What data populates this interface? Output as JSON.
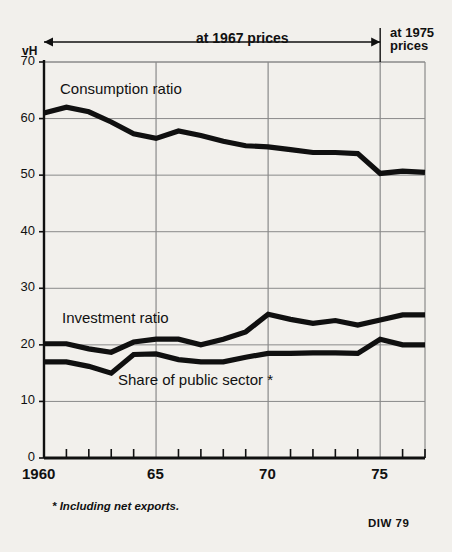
{
  "axis": {
    "unit_label": "vH",
    "y_ticks": [
      70,
      60,
      50,
      40,
      30,
      20,
      10,
      0
    ],
    "x_ticks": [
      {
        "value": 1960,
        "label": "1960"
      },
      {
        "value": 1965,
        "label": "65"
      },
      {
        "value": 1970,
        "label": "70"
      },
      {
        "value": 1975,
        "label": "75"
      }
    ]
  },
  "annotations": {
    "period_left": "at 1967 prices",
    "period_right_line1": "at 1975",
    "period_right_line2": "prices",
    "footnote": "* Including net exports.",
    "source": "DIW 79"
  },
  "series_labels": {
    "consumption": "Consumption ratio",
    "investment": "Investment ratio",
    "public_sector": "Share of public sector *"
  },
  "colors": {
    "line": "#101010",
    "grid": "#8a8a8a",
    "axis": "#101010",
    "background": "#f2f0ec"
  },
  "chart_data": {
    "type": "line",
    "title": "",
    "subtitle": "",
    "xlabel": "",
    "ylabel": "vH",
    "xlim": [
      1960,
      1977
    ],
    "ylim": [
      0,
      70
    ],
    "grid": true,
    "legend_position": "inline-labels",
    "x": [
      1960,
      1961,
      1962,
      1963,
      1964,
      1965,
      1966,
      1967,
      1968,
      1969,
      1970,
      1971,
      1972,
      1973,
      1974,
      1975,
      1976,
      1977
    ],
    "series": [
      {
        "name": "Consumption ratio",
        "values": [
          61.0,
          62.0,
          61.2,
          59.4,
          57.3,
          56.5,
          57.8,
          57.0,
          56.0,
          55.2,
          55.0,
          54.5,
          54.0,
          54.0,
          53.8,
          50.3,
          50.7,
          50.5
        ]
      },
      {
        "name": "Investment ratio",
        "values": [
          20.2,
          20.2,
          19.3,
          18.7,
          20.5,
          21.0,
          21.0,
          20.0,
          21.0,
          22.3,
          25.4,
          24.5,
          23.8,
          24.3,
          23.5,
          24.4,
          25.3,
          25.3
        ]
      },
      {
        "name": "Share of public sector",
        "values": [
          17.0,
          17.0,
          16.2,
          15.0,
          18.3,
          18.4,
          17.4,
          17.0,
          17.0,
          17.8,
          18.5,
          18.5,
          18.6,
          18.6,
          18.5,
          21.0,
          20.0,
          20.0
        ]
      }
    ],
    "annotations": [
      {
        "text": "at 1967 prices",
        "x_start": 1960,
        "x_end": 1975
      },
      {
        "text": "at 1975 prices",
        "x_start": 1975,
        "x_end": 1977
      }
    ],
    "footnote": "* Including net exports.",
    "source": "DIW 79"
  }
}
